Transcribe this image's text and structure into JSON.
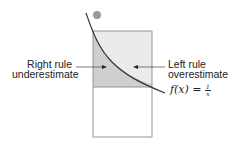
{
  "diagram": {
    "labels": {
      "right_rule": [
        "Right rule",
        "underestimate"
      ],
      "left_rule": [
        "Left rule",
        "overestimate"
      ],
      "function": {
        "lhs": "f(x) = ",
        "numerator": "1",
        "denominator": "x"
      }
    },
    "colors": {
      "overestimate_fill": "#ebebeb",
      "underestimate_fill": "#cfcfcf",
      "outline": "#777777",
      "curve": "#333333",
      "arrow": "#444444",
      "blob": "#9a9a9a"
    }
  }
}
